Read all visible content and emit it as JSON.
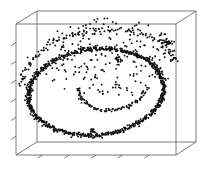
{
  "figure": {
    "kind": "3d-scatter-plot",
    "title": "",
    "background_color": "#ffffff",
    "axis_color": "#6b6b6b",
    "point_color": "#111111"
  },
  "chart_data": {
    "type": "scatter",
    "title": "",
    "subtitle": "",
    "xlabel": "",
    "ylabel": "",
    "zlabel": "",
    "grid": false,
    "legend": null,
    "projection": "3d-wireframe-box",
    "annotations": [],
    "xlim": [
      0,
      1
    ],
    "ylim": [
      0,
      1
    ],
    "zlim": [
      0,
      1
    ],
    "xticks": [
      "",
      "",
      "",
      "",
      ""
    ],
    "yticks": [
      "",
      "",
      "",
      "",
      "",
      ""
    ],
    "zticks": [],
    "tick_labels_visible": false,
    "box": {
      "front_top_left": [
        16,
        24
      ],
      "front_top_right": [
        176,
        24
      ],
      "front_bottom_left": [
        16,
        155
      ],
      "front_bottom_right": [
        176,
        155
      ],
      "back_top_left": [
        37,
        11
      ],
      "back_top_right": [
        196,
        11
      ],
      "back_bottom_left": [
        37,
        142
      ],
      "back_bottom_right": [
        196,
        142
      ]
    },
    "ellipse_main": {
      "cx": 96,
      "cy": 92,
      "rx": 68,
      "ry": 43,
      "rotation_deg": -6,
      "point_count": 420,
      "radial_noise": 3.0
    },
    "ellipse_inner_tail": {
      "cx": 112,
      "cy": 88,
      "rx": 34,
      "ry": 22,
      "rotation_deg": -6,
      "start_deg": 20,
      "end_deg": 190,
      "point_count": 90,
      "radial_noise": 2.6
    },
    "back_arc": {
      "cx": 100,
      "cy": 78,
      "rx": 78,
      "ry": 48,
      "rotation_deg": -7,
      "start_deg": 182,
      "end_deg": 352,
      "point_count": 130,
      "radial_noise": 4.5
    },
    "noise_cloud": {
      "cx": 110,
      "cy": 58,
      "rx": 72,
      "ry": 40,
      "point_count": 230
    },
    "dense_knots": [
      {
        "x": 168,
        "y": 43,
        "r": 4,
        "n": 22
      },
      {
        "x": 118,
        "y": 60,
        "r": 3,
        "n": 14
      },
      {
        "x": 30,
        "y": 92,
        "r": 4,
        "n": 18
      },
      {
        "x": 92,
        "y": 131,
        "r": 4,
        "n": 16
      }
    ],
    "point_radius": 0.95,
    "total_points": 900
  }
}
